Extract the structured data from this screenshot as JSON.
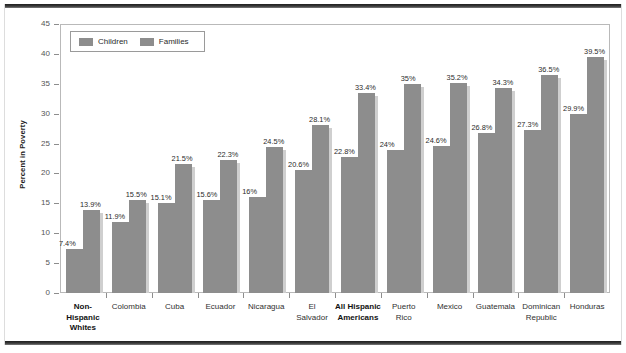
{
  "figure": {
    "bar_color": "#8d8d8d",
    "frame_color": "#b9b9b9",
    "background": "#ffffff"
  },
  "legend": {
    "items": [
      {
        "label": "Children",
        "color": "#8d8d8d",
        "icon": "legend-swatch-icon"
      },
      {
        "label": "Families",
        "color": "#8d8d8d",
        "icon": "legend-swatch-icon"
      }
    ]
  },
  "chart_data": {
    "type": "bar",
    "title": "",
    "xlabel": "",
    "ylabel": "Percent in Poverty",
    "ylim": [
      0,
      45
    ],
    "yticks": [
      0,
      5,
      10,
      15,
      20,
      25,
      30,
      35,
      40,
      45
    ],
    "grid": true,
    "legend_position": "top-left",
    "categories": [
      "Non-Hispanic Whites",
      "Colombia",
      "Cuba",
      "Ecuador",
      "Nicaragua",
      "El Salvador",
      "All Hispanic Americans",
      "Puerto Rico",
      "Mexico",
      "Guatemala",
      "Dominican Republic",
      "Honduras"
    ],
    "category_lines": [
      [
        "Non-",
        "Hispanic",
        "Whites"
      ],
      [
        "Colombia"
      ],
      [
        "Cuba"
      ],
      [
        "Ecuador"
      ],
      [
        "Nicaragua"
      ],
      [
        "El",
        "Salvador"
      ],
      [
        "All Hispanic",
        "Americans"
      ],
      [
        "Puerto",
        "Rico"
      ],
      [
        "Mexico"
      ],
      [
        "Guatemala"
      ],
      [
        "Dominican",
        "Republic"
      ],
      [
        "Honduras"
      ]
    ],
    "emphasized_categories": [
      "Non-Hispanic Whites",
      "All Hispanic Americans"
    ],
    "series": [
      {
        "name": "Children",
        "values": [
          7.4,
          11.9,
          15.1,
          15.6,
          16,
          20.6,
          22.8,
          24,
          24.6,
          26.8,
          27.3,
          29.9
        ],
        "labels": [
          "7.4%",
          "11.9%",
          "15.1%",
          "15.6%",
          "16%",
          "20.6%",
          "22.8%",
          "24%",
          "24.6%",
          "26.8%",
          "27.3%",
          "29.9%"
        ]
      },
      {
        "name": "Families",
        "values": [
          13.9,
          15.5,
          21.5,
          22.3,
          24.5,
          28.1,
          33.4,
          35,
          35.2,
          34.3,
          36.5,
          39.5
        ],
        "labels": [
          "13.9%",
          "15.5%",
          "21.5%",
          "22.3%",
          "24.5%",
          "28.1%",
          "33.4%",
          "35%",
          "35.2%",
          "34.3%",
          "36.5%",
          "39.5%"
        ]
      }
    ]
  }
}
